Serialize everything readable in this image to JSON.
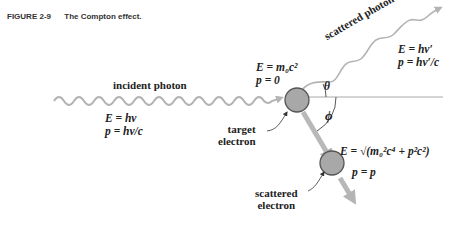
{
  "figure": {
    "number": "FIGURE 2-9",
    "title": "The Compton effect."
  },
  "labels": {
    "incident_photon": "incident photon",
    "scattered_photon": "scattered photon",
    "target_electron_line1": "target",
    "target_electron_line2": "electron",
    "scattered_electron_line1": "scattered",
    "scattered_electron_line2": "electron",
    "theta": "θ",
    "phi": "ϕ"
  },
  "equations": {
    "incident_E": "E = hν",
    "incident_p": "p = hν/c",
    "target_E": "E = m₀c²",
    "target_p": "p = 0",
    "scattered_photon_E": "E = hν′",
    "scattered_photon_p": "p = hν′/c",
    "scattered_electron_E": "E = √(m₀²c⁴ + p²c²)",
    "scattered_electron_p": "p = p"
  },
  "colors": {
    "arrow_gray": "#b4b4b4",
    "electron_fill": "#a8a8a8",
    "electron_stroke": "#555555",
    "text": "#222222"
  }
}
